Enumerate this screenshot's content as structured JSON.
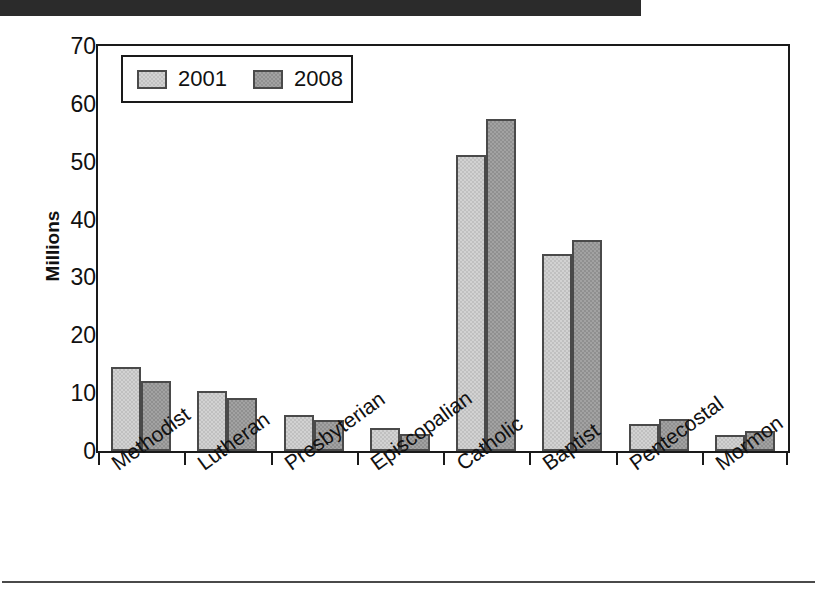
{
  "page": {
    "top_bar_color": "#2b2b2b",
    "background_color": "#ffffff"
  },
  "legend": {
    "position": "inside-top-left",
    "entries": [
      {
        "label": "2001",
        "color": "#d2d2d2",
        "swatch_icon": "legend-swatch-icon"
      },
      {
        "label": "2008",
        "color": "#a2a2a2",
        "swatch_icon": "legend-swatch-icon"
      }
    ]
  },
  "chart_data": {
    "type": "bar",
    "title": "",
    "xlabel": "",
    "ylabel": "Millions",
    "ylim": [
      0,
      70
    ],
    "yticks": [
      0,
      10,
      20,
      30,
      40,
      50,
      60,
      70
    ],
    "ytick_labels": [
      "0",
      "10",
      "20",
      "30",
      "40",
      "50",
      "60",
      "70"
    ],
    "grid": false,
    "legend_position": "upper left",
    "categories": [
      "Methodist",
      "Lutheran",
      "Presbyterian",
      "Episcopalian",
      "Catholic",
      "Baptist",
      "Pentecostal",
      "Mormon"
    ],
    "series": [
      {
        "name": "2001",
        "color": "#d2d2d2",
        "values": [
          14.6,
          10.3,
          6.3,
          3.9,
          51.2,
          34.1,
          4.6,
          2.7
        ]
      },
      {
        "name": "2008",
        "color": "#a2a2a2",
        "values": [
          12.1,
          9.2,
          5.3,
          3.0,
          57.4,
          36.4,
          5.6,
          3.4
        ]
      }
    ]
  }
}
